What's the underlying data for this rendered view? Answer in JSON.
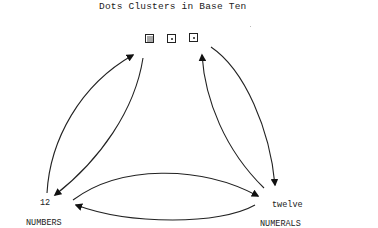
{
  "title": "Dots Clusters in Base Ten",
  "top_node": {
    "boxes": [
      {
        "kind": "ten-dots-cluster"
      },
      {
        "kind": "single-dot"
      },
      {
        "kind": "single-dot"
      }
    ]
  },
  "left_node": {
    "value": "12",
    "caption": "NUMBERS"
  },
  "right_node": {
    "value": "twelve",
    "caption": "NUMERALS"
  },
  "arrows": [
    {
      "from": "top",
      "to": "left",
      "style": "curved"
    },
    {
      "from": "left",
      "to": "top",
      "style": "curved"
    },
    {
      "from": "top",
      "to": "right",
      "style": "curved"
    },
    {
      "from": "right",
      "to": "top",
      "style": "curved"
    },
    {
      "from": "left",
      "to": "right",
      "style": "curved"
    },
    {
      "from": "right",
      "to": "left",
      "style": "curved"
    }
  ],
  "colors": {
    "ink": "#222222",
    "background": "#ffffff"
  }
}
